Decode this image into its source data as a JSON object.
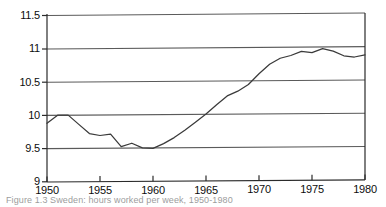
{
  "figure": {
    "caption": "Figure 1.3  Sweden: hours worked per week, 1950-1980",
    "caption_note": "caption is cropped at the bottom edge of the image"
  },
  "axes": {
    "y_ticks": [
      "11.5",
      "11",
      "10.5",
      "10",
      "9.5",
      "9"
    ],
    "x_ticks": [
      "1950",
      "1955",
      "1960",
      "1965",
      "1970",
      "1975",
      "1980"
    ]
  },
  "style": {
    "line_color": "#3a3a3a",
    "grid_color": "#5a5a5a",
    "frame_color": "#2b2b2b",
    "background": "#ffffff",
    "tick_label_color": "#0d0d0d"
  },
  "chart_data": {
    "type": "line",
    "title": "",
    "subtitle": "",
    "xlabel": "",
    "ylabel": "",
    "xlim": [
      1950,
      1980
    ],
    "ylim": [
      9,
      11.5
    ],
    "yticks": [
      9,
      9.5,
      10,
      10.5,
      11,
      11.5
    ],
    "xticks": [
      1950,
      1955,
      1960,
      1965,
      1970,
      1975,
      1980
    ],
    "grid": "horizontal",
    "legend": "none",
    "series": [
      {
        "name": "series-1",
        "x": [
          1950,
          1951,
          1952,
          1953,
          1954,
          1955,
          1956,
          1957,
          1958,
          1959,
          1960,
          1961,
          1962,
          1963,
          1964,
          1965,
          1966,
          1967,
          1968,
          1969,
          1970,
          1971,
          1972,
          1973,
          1974,
          1975,
          1976,
          1977,
          1978,
          1979,
          1980
        ],
        "y": [
          9.88,
          10.0,
          10.0,
          9.86,
          9.72,
          9.69,
          9.71,
          9.52,
          9.57,
          9.5,
          9.49,
          9.56,
          9.65,
          9.76,
          9.88,
          10.0,
          10.14,
          10.27,
          10.34,
          10.44,
          10.6,
          10.74,
          10.83,
          10.87,
          10.93,
          10.91,
          10.97,
          10.93,
          10.86,
          10.84,
          10.87
        ]
      }
    ]
  }
}
